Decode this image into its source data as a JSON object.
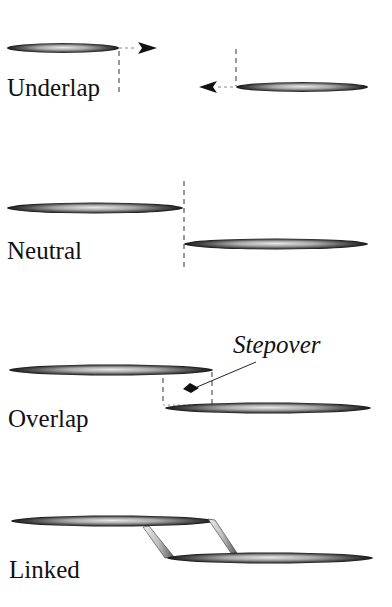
{
  "figure": {
    "panels": [
      {
        "id": "underlap",
        "label": "Underlap"
      },
      {
        "id": "neutral",
        "label": "Neutral"
      },
      {
        "id": "overlap",
        "label": "Overlap",
        "annotation": "Stepover"
      },
      {
        "id": "linked",
        "label": "Linked"
      }
    ],
    "colors": {
      "segment_dark": "#1a1a1a",
      "segment_light": "#e6e6e6",
      "guide_line": "#555555",
      "text": "#111111",
      "background": "#ffffff"
    }
  }
}
